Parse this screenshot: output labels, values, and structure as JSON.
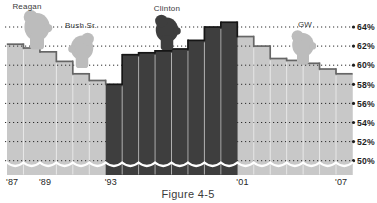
{
  "chart_data": {
    "type": "bar",
    "title": "",
    "caption": "Figure 4-5",
    "unit": "%",
    "categories": [
      "'87",
      "'88",
      "'89",
      "'90",
      "'91",
      "'92",
      "'93",
      "'94",
      "'95",
      "'96",
      "'97",
      "'98",
      "'99",
      "'00",
      "'01",
      "'02",
      "'03",
      "'04",
      "'05",
      "'06",
      "'07"
    ],
    "values": [
      62.2,
      61.8,
      61.4,
      60.4,
      59.1,
      58.4,
      58.0,
      61.1,
      61.3,
      61.5,
      61.7,
      62.6,
      64.0,
      64.5,
      63.0,
      62.0,
      60.7,
      60.5,
      60.2,
      59.6,
      59.1
    ],
    "eras": [
      "reagan",
      "reagan",
      "bush",
      "bush",
      "bush",
      "bush",
      "clinton",
      "clinton",
      "clinton",
      "clinton",
      "clinton",
      "clinton",
      "clinton",
      "clinton",
      "gw",
      "gw",
      "gw",
      "gw",
      "gw",
      "gw",
      "gw"
    ],
    "era_shades": {
      "reagan": "light",
      "bush": "light",
      "clinton": "dark",
      "gw": "light"
    },
    "presidents": [
      {
        "name": "Reagan",
        "label_x": 27,
        "label_y": 9,
        "head_cx": 37,
        "head_cy": 27,
        "head_r": 14,
        "shade": "light",
        "flip": 1
      },
      {
        "name": "Bush Sr.",
        "label_x": 81,
        "label_y": 28,
        "head_cx": 82,
        "head_cy": 48,
        "head_r": 12.5,
        "shade": "light",
        "flip": -1
      },
      {
        "name": "Clinton",
        "label_x": 167,
        "label_y": 11,
        "head_cx": 167,
        "head_cy": 30,
        "head_r": 12.5,
        "shade": "dark",
        "flip": 1
      },
      {
        "name": "GW",
        "label_x": 305,
        "label_y": 27,
        "head_cx": 303,
        "head_cy": 45,
        "head_r": 12,
        "shade": "light",
        "flip": 1
      }
    ],
    "y_ticks": [
      {
        "label": "64%",
        "value": 64
      },
      {
        "label": "62%",
        "value": 62
      },
      {
        "label": "60%",
        "value": 60
      },
      {
        "label": "58%",
        "value": 58
      },
      {
        "label": "56%",
        "value": 56
      },
      {
        "label": "54%",
        "value": 54
      },
      {
        "label": "52%",
        "value": 52
      },
      {
        "label": "50%",
        "value": 50
      }
    ],
    "x_ticks_shown": [
      {
        "label": "'87",
        "index": 0
      },
      {
        "label": "'89",
        "index": 2
      },
      {
        "label": "'93",
        "index": 6
      },
      {
        "label": "'01",
        "index": 14
      },
      {
        "label": "'07",
        "index": 20
      }
    ],
    "axis_break_squiggle": true,
    "ylim": [
      48,
      66
    ],
    "grid": true,
    "legend_position": "none",
    "colors": {
      "light_bar": "#c8c8c8",
      "dark_bar": "#3e3e3e",
      "light_edge": "#666666",
      "dark_edge": "#161616",
      "head_light": "#bcbcbc",
      "head_dark": "#3e3e3e",
      "gridline": "#2b2b2b",
      "axis_text": "#1e1e1e",
      "label_text": "#3a3a3a",
      "separator": "rgba(255,255,255,0.55)",
      "squiggle": "#ffffff",
      "background": "#ffffff"
    }
  }
}
